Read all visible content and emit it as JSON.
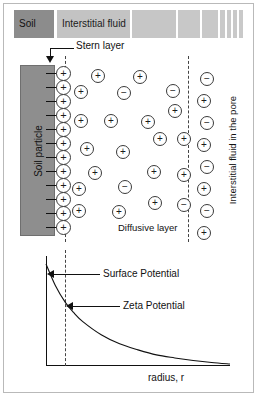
{
  "figure": {
    "width": 257,
    "height": 396
  },
  "colors": {
    "soil_block": "#8c8c8c",
    "soil_particle": "#8e8e8e",
    "ion_outline": "#3a3a3a",
    "axis": "#111111",
    "dashed": "#444444",
    "frame": "#b9b9b9",
    "background": "#ffffff"
  },
  "header": {
    "blocks": [
      {
        "label": "Soil",
        "shade": "#8c8c8c",
        "x": 0,
        "width": 40,
        "has_label": true
      },
      {
        "label": "Interstitial fluid",
        "shade": "#c3c3c3",
        "x": 43,
        "width": 73,
        "has_label": true
      },
      {
        "label": "",
        "shade": "#c6c6c6",
        "x": 118,
        "width": 44,
        "has_label": false
      },
      {
        "label": "",
        "shade": "#c8c8c8",
        "x": 164,
        "width": 22,
        "has_label": false
      },
      {
        "label": "",
        "shade": "#c8c8c8",
        "x": 188,
        "width": 16,
        "has_label": false
      },
      {
        "label": "",
        "shade": "#c9c9c9",
        "x": 206,
        "width": 5,
        "has_label": false
      },
      {
        "label": "",
        "shade": "#c9c9c9",
        "x": 213,
        "width": 4,
        "has_label": false
      },
      {
        "label": "",
        "shade": "#c9c9c9",
        "x": 219,
        "width": 4,
        "has_label": false
      },
      {
        "label": "",
        "shade": "#c9c9c9",
        "x": 225,
        "width": 4,
        "has_label": false
      }
    ]
  },
  "annotations": {
    "stern_layer": "Stern layer",
    "diffusive_layer": "Diffusive layer",
    "soil_particle": "Soil particle",
    "pore_fluid": "Interstitial fluid in the pore",
    "surface_potential": "Surface Potential",
    "zeta_potential": "Zeta Potential"
  },
  "ions": {
    "stern_charge": "+",
    "stern_count": 12,
    "stern_column": [
      {
        "x": 56,
        "y": 66
      },
      {
        "x": 56,
        "y": 80
      },
      {
        "x": 56,
        "y": 94
      },
      {
        "x": 56,
        "y": 108
      },
      {
        "x": 56,
        "y": 122
      },
      {
        "x": 56,
        "y": 136
      },
      {
        "x": 56,
        "y": 150
      },
      {
        "x": 56,
        "y": 164
      },
      {
        "x": 56,
        "y": 178
      },
      {
        "x": 56,
        "y": 192
      },
      {
        "x": 56,
        "y": 206
      },
      {
        "x": 56,
        "y": 220
      }
    ],
    "diffuse_layer": [
      {
        "charge": "+",
        "x": 91,
        "y": 69
      },
      {
        "charge": "+",
        "x": 133,
        "y": 70
      },
      {
        "charge": "+",
        "x": 74,
        "y": 85
      },
      {
        "charge": "−",
        "x": 117,
        "y": 86
      },
      {
        "charge": "−",
        "x": 166,
        "y": 84
      },
      {
        "charge": "+",
        "x": 168,
        "y": 104
      },
      {
        "charge": "+",
        "x": 74,
        "y": 114
      },
      {
        "charge": "+",
        "x": 104,
        "y": 114
      },
      {
        "charge": "+",
        "x": 141,
        "y": 115
      },
      {
        "charge": "+",
        "x": 153,
        "y": 132
      },
      {
        "charge": "+",
        "x": 177,
        "y": 132
      },
      {
        "charge": "+",
        "x": 80,
        "y": 142
      },
      {
        "charge": "+",
        "x": 116,
        "y": 145
      },
      {
        "charge": "+",
        "x": 88,
        "y": 166
      },
      {
        "charge": "+",
        "x": 147,
        "y": 165
      },
      {
        "charge": "+",
        "x": 177,
        "y": 168
      },
      {
        "charge": "−",
        "x": 118,
        "y": 180
      },
      {
        "charge": "+",
        "x": 72,
        "y": 182
      },
      {
        "charge": "+",
        "x": 148,
        "y": 196
      },
      {
        "charge": "−",
        "x": 177,
        "y": 198
      },
      {
        "charge": "+",
        "x": 72,
        "y": 204
      },
      {
        "charge": "+",
        "x": 112,
        "y": 205
      }
    ],
    "bulk_fluid": [
      {
        "charge": "−",
        "x": 200,
        "y": 72
      },
      {
        "charge": "+",
        "x": 197,
        "y": 94
      },
      {
        "charge": "−",
        "x": 200,
        "y": 116
      },
      {
        "charge": "+",
        "x": 197,
        "y": 138
      },
      {
        "charge": "−",
        "x": 200,
        "y": 160
      },
      {
        "charge": "+",
        "x": 197,
        "y": 182
      },
      {
        "charge": "−",
        "x": 200,
        "y": 204
      },
      {
        "charge": "+",
        "x": 197,
        "y": 226
      }
    ]
  },
  "chart_data": {
    "type": "line",
    "title": "",
    "xlabel": "radius, r",
    "ylabel": "",
    "grid": false,
    "legend": "none",
    "annotations": [
      {
        "label": "Surface Potential",
        "at_x": 0,
        "at_y": 1.0
      },
      {
        "label": "Zeta Potential",
        "at_x": 0.105,
        "at_y": 0.62
      }
    ],
    "markers": [
      {
        "name": "shear-plane",
        "x": 0.105,
        "style": "dashed-vertical"
      }
    ],
    "x": [
      0,
      0.05,
      0.105,
      0.15,
      0.2,
      0.3,
      0.4,
      0.5,
      0.6,
      0.7,
      0.8,
      0.9,
      1.0
    ],
    "y": [
      1.0,
      0.79,
      0.62,
      0.52,
      0.43,
      0.3,
      0.21,
      0.15,
      0.1,
      0.07,
      0.045,
      0.025,
      0.01
    ],
    "xlim": [
      0,
      1
    ],
    "ylim": [
      0,
      1
    ]
  }
}
